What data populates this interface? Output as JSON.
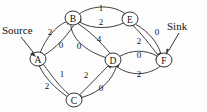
{
  "diagram": {
    "type": "directed-graph",
    "width": 207,
    "height": 112,
    "background_color": "#fdfdfd",
    "stroke_color": "#2b2b2b",
    "text_color": "#111111",
    "nodes": [
      {
        "id": "A",
        "label": "A",
        "x": 38,
        "y": 59,
        "r": 7.5
      },
      {
        "id": "B",
        "label": "B",
        "x": 73,
        "y": 18,
        "r": 7.5
      },
      {
        "id": "C",
        "label": "C",
        "x": 74,
        "y": 100,
        "r": 7.5
      },
      {
        "id": "D",
        "label": "D",
        "x": 113,
        "y": 60,
        "r": 7.5
      },
      {
        "id": "E",
        "label": "E",
        "x": 130,
        "y": 19,
        "r": 7.5
      },
      {
        "id": "F",
        "label": "F",
        "x": 164,
        "y": 60,
        "r": 7.5
      }
    ],
    "edges": [
      {
        "id": "A-B",
        "from": "A",
        "to": "B",
        "label": "2",
        "label_x": 50,
        "label_y": 32
      },
      {
        "id": "B-A",
        "from": "B",
        "to": "A",
        "label": "0",
        "label_x": 61,
        "label_y": 45
      },
      {
        "id": "B-E",
        "from": "B",
        "to": "E",
        "label": "1",
        "label_x": 101,
        "label_y": 8
      },
      {
        "id": "E-B",
        "from": "E",
        "to": "B",
        "label": "2",
        "label_x": 101,
        "label_y": 22
      },
      {
        "id": "B-D",
        "from": "B",
        "to": "D",
        "label": "0",
        "label_x": 79,
        "label_y": 46
      },
      {
        "id": "D-B",
        "from": "D",
        "to": "B",
        "label": "4",
        "label_x": 99,
        "label_y": 39
      },
      {
        "id": "A-C",
        "from": "A",
        "to": "C",
        "label": "1",
        "label_x": 62,
        "label_y": 74
      },
      {
        "id": "C-A",
        "from": "C",
        "to": "A",
        "label": "2",
        "label_x": 47,
        "label_y": 86
      },
      {
        "id": "C-D",
        "from": "C",
        "to": "D",
        "label": "2",
        "label_x": 86,
        "label_y": 75
      },
      {
        "id": "D-C",
        "from": "D",
        "to": "C",
        "label": "0",
        "label_x": 101,
        "label_y": 88
      },
      {
        "id": "E-F",
        "from": "E",
        "to": "F",
        "label": "0",
        "label_x": 157,
        "label_y": 32
      },
      {
        "id": "F-E",
        "from": "F",
        "to": "E",
        "label": "2",
        "label_x": 139,
        "label_y": 41
      },
      {
        "id": "D-F",
        "from": "D",
        "to": "F",
        "label": "0",
        "label_x": 139,
        "label_y": 55
      },
      {
        "id": "F-D",
        "from": "F",
        "to": "D",
        "label": "2",
        "label_x": 139,
        "label_y": 74
      }
    ],
    "annotations": [
      {
        "id": "source",
        "label": "Source",
        "text_x": 2,
        "text_y": 30,
        "target_node": "A"
      },
      {
        "id": "sink",
        "label": "Sink",
        "text_x": 167,
        "text_y": 26,
        "target_node": "F"
      }
    ]
  }
}
